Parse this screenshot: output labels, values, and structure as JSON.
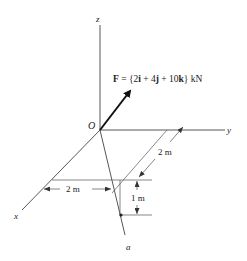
{
  "diagram": {
    "axes": {
      "x_label": "x",
      "y_label": "y",
      "z_label": "z",
      "origin_label": "O"
    },
    "force": {
      "symbol": "F",
      "equals": " = {2",
      "i": "i",
      "plus1": " + 4",
      "j": "j",
      "plus2": " + 10",
      "k": "k",
      "unit": "} kN"
    },
    "line_label": "a",
    "dimensions": {
      "horizontal": "2 m",
      "slanted": "2 m",
      "vertical": "1 m"
    },
    "colors": {
      "line": "#333333",
      "arrow": "#111111"
    }
  }
}
